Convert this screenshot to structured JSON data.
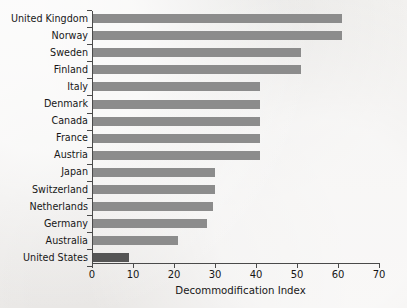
{
  "chart_data": {
    "type": "bar",
    "orientation": "horizontal",
    "title": "",
    "subtitle": "",
    "xlabel": "Decommodification Index",
    "ylabel": "",
    "xlim": [
      0,
      70
    ],
    "xticks": [
      0,
      10,
      20,
      30,
      40,
      50,
      60,
      70
    ],
    "xtick_labels": [
      "0",
      "10",
      "20",
      "30",
      "40",
      "50",
      "60",
      "70"
    ],
    "grid": false,
    "legend": false,
    "legend_position": "none",
    "categories": [
      "United Kingdom",
      "Norway",
      "Sweden",
      "Finland",
      "Italy",
      "Denmark",
      "Canada",
      "France",
      "Austria",
      "Japan",
      "Switzerland",
      "Netherlands",
      "Germany",
      "Australia",
      "United States"
    ],
    "values": [
      61,
      61,
      51,
      51,
      41,
      41,
      41,
      41,
      41,
      30,
      30,
      29.5,
      28,
      21,
      9
    ],
    "bar_colors": [
      "#8c8c8c",
      "#8c8c8c",
      "#8c8c8c",
      "#8c8c8c",
      "#8c8c8c",
      "#8c8c8c",
      "#8c8c8c",
      "#8c8c8c",
      "#8c8c8c",
      "#8c8c8c",
      "#8c8c8c",
      "#8c8c8c",
      "#8c8c8c",
      "#8c8c8c",
      "#555555"
    ],
    "highlight_category": "United States",
    "colors": {
      "bar_default": "#8c8c8c",
      "bar_highlight": "#555555",
      "axis": "#4a4a4a",
      "text": "#171717",
      "background": "#eeecea"
    }
  }
}
